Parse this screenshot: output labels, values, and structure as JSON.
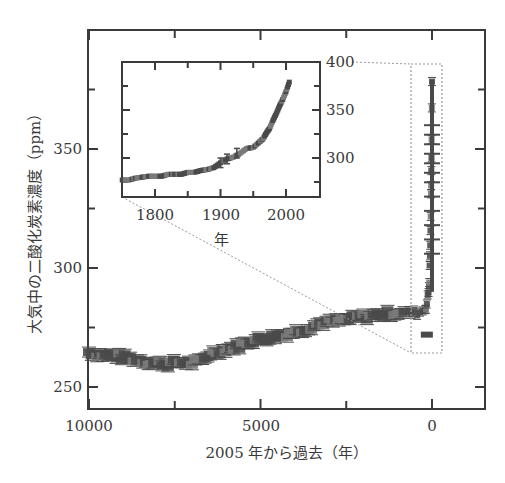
{
  "chart_data": [
    {
      "id": "main",
      "type": "scatter",
      "title": "",
      "xlabel": "2005 年から過去（年）",
      "ylabel": "大気中の二酸化炭素濃度（ppm）",
      "xlim": [
        10000,
        -1540
      ],
      "ylim": [
        241,
        400
      ],
      "x_reversed": true,
      "grid": false,
      "legend": null,
      "x_ticks": [
        10000,
        5000,
        0
      ],
      "x_tick_labels": [
        "10000",
        "5000",
        "0"
      ],
      "x_minor_ticks": [
        7500,
        2500
      ],
      "y_ticks": [
        250,
        300,
        350
      ],
      "y_tick_labels": [
        "250",
        "300",
        "350"
      ],
      "y_minor_ticks": [
        275,
        325,
        375
      ],
      "marker": "error-bar squares",
      "series": [
        {
          "name": "CO2 (ice core + atmospheric)",
          "x": [
            10000,
            9600,
            9200,
            8800,
            8500,
            8100,
            7700,
            7350,
            7000,
            6700,
            6470,
            6100,
            5700,
            5300,
            4900,
            4500,
            4140,
            3700,
            3260,
            2800,
            2400,
            2000,
            1800,
            1500,
            1200,
            900,
            600,
            350,
            200,
            150,
            100,
            80,
            60,
            45,
            30,
            20,
            10,
            0
          ],
          "y": [
            264.7,
            263.5,
            263.0,
            262.0,
            261.3,
            260.2,
            259.8,
            260.5,
            260.0,
            260.8,
            264.3,
            265.5,
            267.0,
            269.3,
            270.5,
            271.5,
            272.7,
            274.5,
            276.9,
            277.5,
            278.5,
            279.5,
            279.8,
            280.5,
            281.0,
            281.5,
            281.0,
            281.5,
            283.0,
            285.0,
            290.0,
            295.0,
            305.0,
            315.0,
            330.0,
            340.0,
            355.0,
            379.0
          ]
        }
      ],
      "annotations": [
        {
          "type": "dashed-rect",
          "x_range": [
            600,
            -300
          ],
          "y_range": [
            264,
            388
          ],
          "label": "zoom region"
        }
      ]
    },
    {
      "id": "inset",
      "type": "scatter",
      "title": "",
      "xlabel": "年",
      "ylabel": "",
      "xlim": [
        1750,
        2052
      ],
      "ylim": [
        260,
        400
      ],
      "grid": false,
      "legend": null,
      "x_ticks": [
        1800,
        1900,
        2000
      ],
      "x_tick_labels": [
        "1800",
        "1900",
        "2000"
      ],
      "x_minor_ticks": [
        1850,
        1950
      ],
      "y_ticks": [
        300,
        350,
        400
      ],
      "y_tick_labels": [
        "300",
        "350",
        "400"
      ],
      "y_minor_ticks": [
        275,
        325,
        375
      ],
      "y_axis_side": "right",
      "series": [
        {
          "name": "CO2 1750-2005",
          "x": [
            1750,
            1760,
            1770,
            1780,
            1790,
            1800,
            1810,
            1820,
            1830,
            1840,
            1850,
            1860,
            1870,
            1880,
            1890,
            1900,
            1910,
            1920,
            1930,
            1940,
            1950,
            1960,
            1965,
            1970,
            1975,
            1980,
            1985,
            1990,
            1995,
            2000,
            2005
          ],
          "y": [
            277,
            277,
            279,
            280,
            281,
            281,
            281,
            283,
            283,
            283,
            285,
            285,
            287,
            288,
            290,
            295,
            299,
            301,
            305,
            310,
            311,
            317,
            320,
            326,
            331,
            339,
            346,
            354,
            361,
            369,
            379
          ]
        }
      ],
      "error_bars_at": [
        1900,
        1910,
        1925
      ]
    }
  ],
  "colors": {
    "axis": "#3a3a3a",
    "data": "#4a4a4a",
    "data_light": "#7a7a7a",
    "dashed": "#9a9a9a",
    "background": "#ffffff"
  },
  "labels": {
    "main_xlabel": "2005 年から過去（年）",
    "main_ylabel": "大気中の二酸化炭素濃度（ppm）",
    "inset_xlabel": "年",
    "main_x_ticks": [
      "10000",
      "5000",
      "0"
    ],
    "main_y_ticks": [
      "350",
      "300",
      "250"
    ],
    "inset_x_ticks": [
      "1800",
      "1900",
      "2000"
    ],
    "inset_y_ticks": [
      "400",
      "350",
      "300"
    ]
  }
}
